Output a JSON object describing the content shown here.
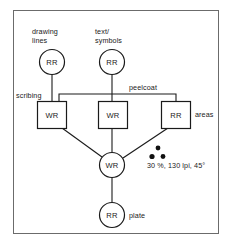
{
  "diagram": {
    "title": "",
    "nodes": [
      {
        "id": "drawing-lines",
        "label": "RR",
        "shape": "circle",
        "cx": 52,
        "cy": 62,
        "r": 12.5
      },
      {
        "id": "text-symbols",
        "label": "RR",
        "shape": "circle",
        "cx": 112,
        "cy": 62,
        "r": 12.5
      },
      {
        "id": "scribing",
        "label": "WR",
        "shape": "rect",
        "x": 37,
        "y": 101,
        "w": 29,
        "h": 27
      },
      {
        "id": "middle-wr",
        "label": "WR",
        "shape": "rect",
        "x": 98,
        "y": 101,
        "w": 29,
        "h": 27
      },
      {
        "id": "areas",
        "label": "RR",
        "shape": "rect",
        "x": 161,
        "y": 101,
        "w": 29,
        "h": 27
      },
      {
        "id": "center-wr",
        "label": "WR",
        "shape": "circle",
        "cx": 112,
        "cy": 165,
        "r": 12.5
      },
      {
        "id": "plate",
        "label": "RR",
        "shape": "circle",
        "cx": 112,
        "cy": 215,
        "r": 12.5
      }
    ],
    "labels": [
      {
        "id": "drawing-lines-label",
        "lines": [
          "drawing",
          "lines"
        ],
        "x": 32,
        "y": 31,
        "anchor": "start"
      },
      {
        "id": "text-symbols-label",
        "lines": [
          "text/",
          "symbols"
        ],
        "x": 95,
        "y": 31,
        "anchor": "start"
      },
      {
        "id": "scribing-label",
        "lines": [
          "scribing"
        ],
        "x": 16,
        "y": 97,
        "anchor": "start"
      },
      {
        "id": "peelcoat-label",
        "lines": [
          "peelcoat"
        ],
        "x": 129,
        "y": 90,
        "anchor": "start"
      },
      {
        "id": "areas-label",
        "lines": [
          "areas"
        ],
        "x": 195,
        "y": 115,
        "anchor": "start"
      },
      {
        "id": "plate-label",
        "lines": [
          "plate"
        ],
        "x": 129,
        "y": 216,
        "anchor": "start"
      }
    ],
    "annotation": {
      "id": "screen-spec",
      "text": "30 %, 130 lpi, 45°",
      "x": 147,
      "y": 167,
      "dots": [
        {
          "cx": 158,
          "cy": 148,
          "r": 2.4
        },
        {
          "cx": 152,
          "cy": 156,
          "r": 2.6
        },
        {
          "cx": 163,
          "cy": 156,
          "r": 2.4
        }
      ]
    },
    "colors": {
      "frame": "#6b6b6b",
      "stroke": "#1a1a1a",
      "background": "#ffffff",
      "dot": "#111111"
    }
  }
}
